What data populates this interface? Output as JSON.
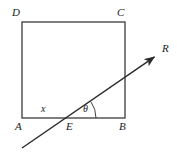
{
  "figure": {
    "background_color": "#ffffff",
    "stroke_color": "#2a2a2a",
    "labels": {
      "vertex_a": "A",
      "vertex_b": "B",
      "vertex_c": "C",
      "vertex_d": "D",
      "point_e": "E",
      "ray_r": "R",
      "segment_x": "x",
      "angle_theta": "θ"
    },
    "geometry": {
      "rectangle": {
        "left": 22,
        "top": 22,
        "right": 125,
        "bottom": 118,
        "width": 103,
        "height": 96
      },
      "point_e": {
        "x": 68,
        "y": 118
      },
      "ray": {
        "start": {
          "x": 22,
          "y": 148
        },
        "end": {
          "x": 157,
          "y": 55
        }
      },
      "arrow_tip": {
        "x": 157,
        "y": 55
      },
      "angle_arc": {
        "center_x": 68,
        "center_y": 118,
        "radius": 28
      }
    },
    "label_positions": {
      "vertex_d": {
        "x": 12,
        "y": 8
      },
      "vertex_c": {
        "x": 117,
        "y": 8
      },
      "vertex_a": {
        "x": 15,
        "y": 121
      },
      "vertex_b": {
        "x": 119,
        "y": 121
      },
      "point_e": {
        "x": 66,
        "y": 121
      },
      "ray_r": {
        "x": 162,
        "y": 44
      },
      "segment_x": {
        "x": 41,
        "y": 104
      },
      "angle_theta": {
        "x": 83,
        "y": 104
      }
    }
  }
}
